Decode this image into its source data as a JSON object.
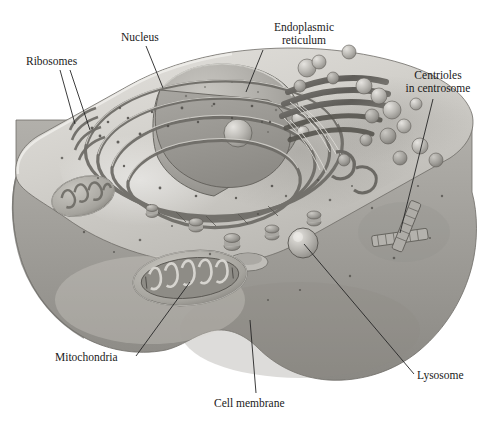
{
  "figure": {
    "background_color": "#ffffff",
    "label_color": "#1a1a1a",
    "leader_line_color": "#262626"
  },
  "labels": [
    {
      "id": "ribosomes",
      "text": "Ribosomes",
      "line1": "Ribosomes",
      "line2": ""
    },
    {
      "id": "nucleus",
      "text": "Nucleus",
      "line1": "Nucleus",
      "line2": ""
    },
    {
      "id": "er",
      "text": "Endoplasmic reticulum",
      "line1": "Endoplasmic",
      "line2": "reticulum"
    },
    {
      "id": "centrioles",
      "text": "Centrioles in centrosome",
      "line1": "Centrioles",
      "line2": "in centrosome"
    },
    {
      "id": "mitochondria",
      "text": "Mitochondria",
      "line1": "Mitochondria",
      "line2": ""
    },
    {
      "id": "cell_membrane",
      "text": "Cell membrane",
      "line1": "Cell membrane",
      "line2": ""
    },
    {
      "id": "lysosome",
      "text": "Lysosome",
      "line1": "Lysosome",
      "line2": ""
    }
  ],
  "organelles": [
    "nucleus",
    "nucleolus",
    "endoplasmic-reticulum",
    "ribosomes",
    "golgi-apparatus",
    "mitochondria",
    "lysosome",
    "centrioles",
    "cell-membrane",
    "vesicles"
  ],
  "palette": {
    "cell_top": "#cfcdc8",
    "cell_top_light": "#dedcd7",
    "cell_side": "#a9a7a3",
    "cell_side_dark": "#8f8d89",
    "nucleus_face": "#9b9995",
    "nucleus_dome": "#b4b2ad",
    "er_light": "#c6c4bf",
    "er_dark": "#88867f",
    "golgi_dark": "#6f6d68",
    "mito_fill": "#b8b6b0",
    "mito_dark": "#7c7a74",
    "outline": "#5b5954"
  }
}
